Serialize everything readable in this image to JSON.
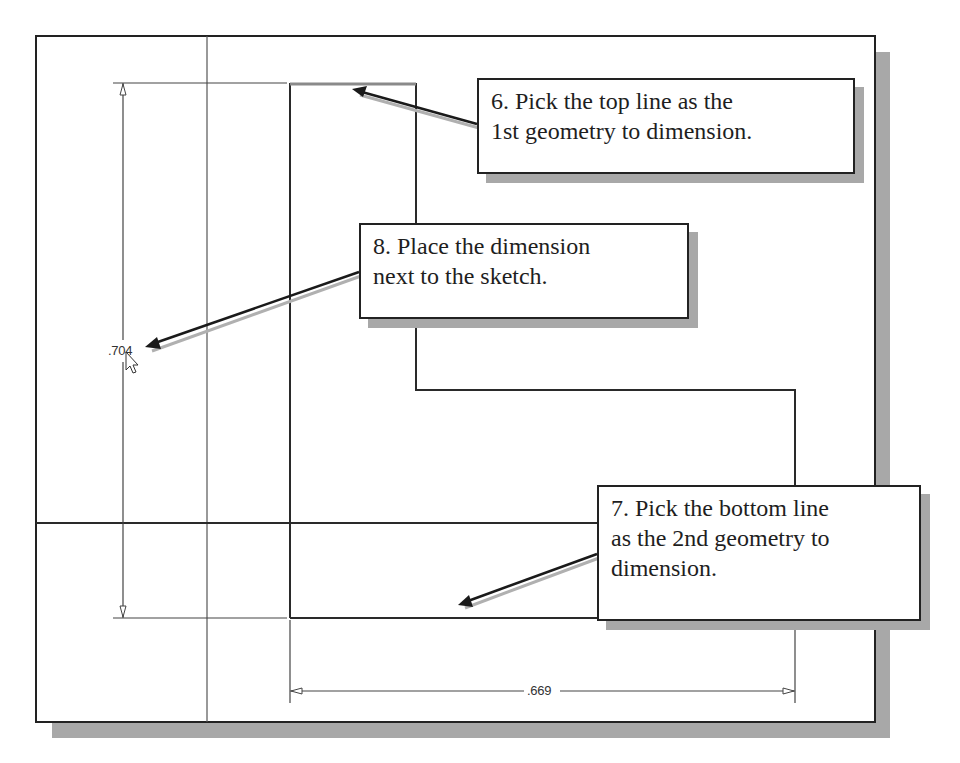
{
  "diagram": {
    "colors": {
      "background": "#ffffff",
      "frame": "#222222",
      "shadow": "#a8a8a8",
      "geometry": "#2a2a2a",
      "construction": "#555555",
      "arrow": "#1a1a1a",
      "arrow_shadow": "#b0b0b0"
    }
  },
  "callouts": [
    {
      "step": "6",
      "lines": [
        "6. Pick the top line as the",
        "1st geometry to dimension."
      ]
    },
    {
      "step": "8",
      "lines": [
        "8. Place the dimension",
        "next to the sketch."
      ]
    },
    {
      "step": "7",
      "lines": [
        "7. Pick the bottom line",
        "as the 2nd geometry to",
        "dimension."
      ]
    }
  ],
  "dimensions": {
    "vertical": ".704",
    "horizontal": ".669"
  },
  "cursor": {
    "icon": "mouse-pointer-icon"
  }
}
